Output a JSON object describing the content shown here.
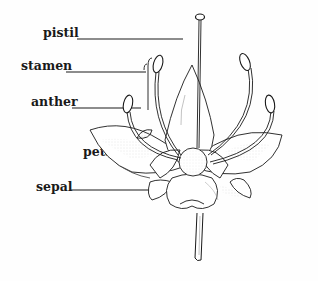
{
  "diagram": {
    "labels": [
      {
        "id": "pistil",
        "text": "pistil"
      },
      {
        "id": "stamen",
        "text": "stamen"
      },
      {
        "id": "anther",
        "text": "anther"
      },
      {
        "id": "petal",
        "text": "petal"
      },
      {
        "id": "sepal",
        "text": "sepal"
      }
    ],
    "colors": {
      "ink": "#1a1a1a",
      "background": "#fefefe",
      "shading": "#9a9a9a"
    }
  }
}
